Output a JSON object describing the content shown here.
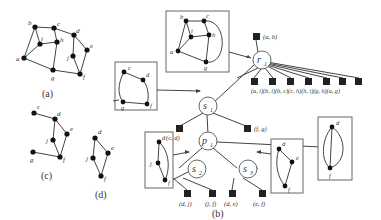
{
  "figure": {
    "captions": {
      "a": "(a)",
      "b": "(b)",
      "c": "(c)",
      "d": "(d)"
    },
    "graph_a": {
      "vertices": [
        "a",
        "b",
        "c",
        "d",
        "e",
        "f",
        "g",
        "h",
        "i",
        "j"
      ],
      "edges": [
        [
          "a",
          "b"
        ],
        [
          "a",
          "i"
        ],
        [
          "b",
          "i"
        ],
        [
          "b",
          "c"
        ],
        [
          "c",
          "h"
        ],
        [
          "i",
          "h"
        ],
        [
          "h",
          "g"
        ],
        [
          "a",
          "g"
        ],
        [
          "g",
          "f"
        ],
        [
          "c",
          "d"
        ],
        [
          "d",
          "e"
        ],
        [
          "e",
          "f"
        ],
        [
          "d",
          "j"
        ],
        [
          "j",
          "f"
        ]
      ]
    },
    "graph_c": {
      "vertices": [
        "c",
        "d",
        "e",
        "f",
        "g",
        "j"
      ],
      "edges": [
        [
          "c",
          "d"
        ],
        [
          "d",
          "e"
        ],
        [
          "e",
          "f"
        ],
        [
          "d",
          "j"
        ],
        [
          "j",
          "f"
        ],
        [
          "g",
          "f"
        ]
      ]
    },
    "graph_d": {
      "vertices": [
        "d",
        "e",
        "f",
        "j"
      ],
      "edges": [
        [
          "d",
          "e"
        ],
        [
          "e",
          "f"
        ],
        [
          "d",
          "j"
        ],
        [
          "j",
          "f"
        ]
      ]
    },
    "spqr_tree": {
      "nodes": {
        "r1": "r",
        "r1_sub": "1",
        "s1": "s",
        "s1_sub": "1",
        "p1": "p",
        "p1_sub": "1",
        "s2": "s",
        "s2_sub": "2",
        "s3": "s",
        "s3_sub": "3"
      },
      "leaf_labels": {
        "ab": "(a, b)",
        "r1_row": "(a, i)(b, i)(b, c)(c, h)(h, i)(g, h)(a, g)",
        "cd": "(c, d)",
        "fg": "(f, g)",
        "dj": "(d, j)",
        "jf": "(j, f)",
        "de": "(d, e)",
        "ef": "(e, f)"
      },
      "skeleton_labels": {
        "r1": [
          "b",
          "c",
          "i",
          "h",
          "a",
          "g"
        ],
        "s1": [
          "c",
          "d",
          "g",
          "f"
        ],
        "s2": [
          "d",
          "j",
          "f"
        ],
        "s3": [
          "d",
          "e",
          "f"
        ],
        "p1": [
          "d",
          "f"
        ]
      }
    }
  }
}
